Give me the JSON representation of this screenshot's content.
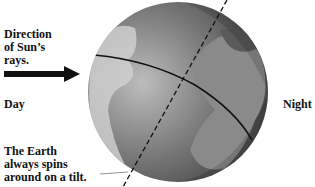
{
  "labels": {
    "direction": [
      "Direction",
      "of Sun’s",
      "rays."
    ],
    "day": "Day",
    "night": "Night",
    "tilt": [
      "The Earth",
      "always spins",
      "around on a tilt."
    ]
  },
  "icons": {
    "arrow": "right-arrow",
    "globe": "earth-globe",
    "axis": "tilted-axis-dashed-line",
    "equator": "equator-line"
  },
  "colors": {
    "text": "#111111",
    "globe_light": "#cfcfcf",
    "globe_dark": "#3a3a3a",
    "background": "#ffffff"
  }
}
